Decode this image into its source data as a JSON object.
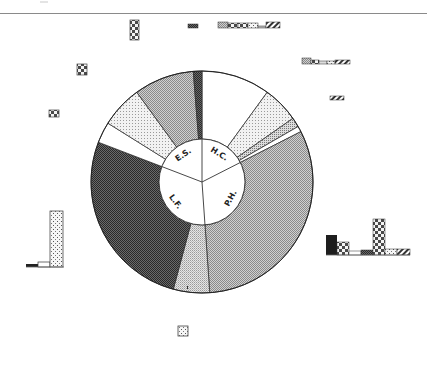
{
  "chart_data": {
    "type": "pie",
    "subtype": "two-level donut (sunburst)",
    "title": "",
    "center": [
      202,
      182
    ],
    "outer_radius": 111,
    "inner_radius": 43,
    "inner_ring": {
      "categories": [
        "H.C.",
        "P.H.",
        "L.F.",
        "E.S."
      ],
      "angles_deg": [
        [
          0,
          63
        ],
        [
          63,
          176
        ],
        [
          176,
          291
        ],
        [
          291,
          360
        ]
      ],
      "values_pct": [
        17.5,
        31.4,
        31.9,
        19.2
      ]
    },
    "outer_ring": [
      {
        "parent": "H.C.",
        "start": 0,
        "end": 36,
        "pattern": "white",
        "value_pct": 10.0
      },
      {
        "parent": "H.C.",
        "start": 36,
        "end": 55,
        "pattern": "light-dots",
        "value_pct": 5.3
      },
      {
        "parent": "H.C.",
        "start": 55,
        "end": 60,
        "pattern": "medium-dots",
        "value_pct": 1.4
      },
      {
        "parent": "H.C.",
        "start": 60,
        "end": 63,
        "pattern": "white",
        "value_pct": 0.8
      },
      {
        "parent": "P.H.",
        "start": 63,
        "end": 176,
        "pattern": "medium-checker",
        "value_pct": 31.4
      },
      {
        "parent": "L.F.",
        "start": 176,
        "end": 195,
        "pattern": "light-checker",
        "value_pct": 5.3
      },
      {
        "parent": "L.F.",
        "start": 195,
        "end": 291,
        "pattern": "dark-checker",
        "value_pct": 26.7
      },
      {
        "parent": "E.S.",
        "start": 291,
        "end": 302,
        "pattern": "white",
        "value_pct": 3.1
      },
      {
        "parent": "E.S.",
        "start": 302,
        "end": 324,
        "pattern": "light-dots",
        "value_pct": 6.1
      },
      {
        "parent": "E.S.",
        "start": 324,
        "end": 355.5,
        "pattern": "medium-checker",
        "value_pct": 8.8
      },
      {
        "parent": "E.S.",
        "start": 355.5,
        "end": 360,
        "pattern": "dark-checker",
        "value_pct": 1.3
      }
    ],
    "labels": [
      "H.C.",
      "P.H.",
      "L.F.",
      "E.S."
    ],
    "legend": "none",
    "grid": false,
    "small_bar_glyphs": [
      {
        "x": 130,
        "y": 20,
        "w": 9,
        "h": 20,
        "pattern": "checker-large"
      },
      {
        "x": 188,
        "y": 24,
        "w": 10,
        "h": 4,
        "pattern": "dark-checker"
      },
      {
        "x": 218,
        "y": 22,
        "w": 62,
        "h": 6,
        "pattern": "mixed-strip"
      },
      {
        "x": 77,
        "y": 64,
        "w": 10,
        "h": 11,
        "pattern": "checker-large"
      },
      {
        "x": 302,
        "y": 58,
        "w": 48,
        "h": 6,
        "pattern": "mixed-strip"
      },
      {
        "x": 330,
        "y": 96,
        "w": 14,
        "h": 4,
        "pattern": "hatch"
      },
      {
        "x": 49,
        "y": 110,
        "w": 10,
        "h": 7,
        "pattern": "checker-large"
      },
      {
        "x": 26,
        "y": 211,
        "w": 20,
        "h": 56,
        "pattern": "bar-group-left"
      },
      {
        "x": 326,
        "y": 218,
        "w": 84,
        "h": 38,
        "pattern": "bar-group-right"
      },
      {
        "x": 178,
        "y": 326,
        "w": 10,
        "h": 10,
        "pattern": "dots-box"
      }
    ]
  }
}
